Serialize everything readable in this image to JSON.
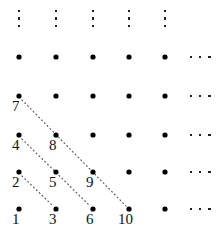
{
  "figure": {
    "width": 222,
    "height": 234,
    "background_color": "#ffffff",
    "dot_color": "#000000",
    "line_color": "#555555",
    "label_color": "#111111"
  },
  "grid": {
    "columns": 5,
    "rows": 5,
    "column_x": [
      19,
      56,
      93,
      129,
      165
    ],
    "row_y": [
      209,
      172,
      135,
      96,
      57
    ],
    "dot_radius": 2.6
  },
  "lattice_points": [
    {
      "id": "dot-c1-r1",
      "col": 1,
      "row": 1,
      "x": 19,
      "y": 209,
      "label": "1"
    },
    {
      "id": "dot-c2-r1",
      "col": 2,
      "row": 1,
      "x": 56,
      "y": 209,
      "label": "3"
    },
    {
      "id": "dot-c3-r1",
      "col": 3,
      "row": 1,
      "x": 93,
      "y": 209,
      "label": "6"
    },
    {
      "id": "dot-c4-r1",
      "col": 4,
      "row": 1,
      "x": 129,
      "y": 209,
      "label": "10"
    },
    {
      "id": "dot-c5-r1",
      "col": 5,
      "row": 1,
      "x": 165,
      "y": 209,
      "label": ""
    },
    {
      "id": "dot-c1-r2",
      "col": 1,
      "row": 2,
      "x": 19,
      "y": 172,
      "label": "2"
    },
    {
      "id": "dot-c2-r2",
      "col": 2,
      "row": 2,
      "x": 56,
      "y": 172,
      "label": "5"
    },
    {
      "id": "dot-c3-r2",
      "col": 3,
      "row": 2,
      "x": 93,
      "y": 172,
      "label": "9"
    },
    {
      "id": "dot-c4-r2",
      "col": 4,
      "row": 2,
      "x": 129,
      "y": 172,
      "label": ""
    },
    {
      "id": "dot-c5-r2",
      "col": 5,
      "row": 2,
      "x": 165,
      "y": 172,
      "label": ""
    },
    {
      "id": "dot-c1-r3",
      "col": 1,
      "row": 3,
      "x": 19,
      "y": 135,
      "label": "4"
    },
    {
      "id": "dot-c2-r3",
      "col": 2,
      "row": 3,
      "x": 56,
      "y": 135,
      "label": "8"
    },
    {
      "id": "dot-c3-r3",
      "col": 3,
      "row": 3,
      "x": 93,
      "y": 135,
      "label": ""
    },
    {
      "id": "dot-c4-r3",
      "col": 4,
      "row": 3,
      "x": 129,
      "y": 135,
      "label": ""
    },
    {
      "id": "dot-c5-r3",
      "col": 5,
      "row": 3,
      "x": 165,
      "y": 135,
      "label": ""
    },
    {
      "id": "dot-c1-r4",
      "col": 1,
      "row": 4,
      "x": 19,
      "y": 96,
      "label": "7"
    },
    {
      "id": "dot-c2-r4",
      "col": 2,
      "row": 4,
      "x": 56,
      "y": 96,
      "label": ""
    },
    {
      "id": "dot-c3-r4",
      "col": 3,
      "row": 4,
      "x": 93,
      "y": 96,
      "label": ""
    },
    {
      "id": "dot-c4-r4",
      "col": 4,
      "row": 4,
      "x": 129,
      "y": 96,
      "label": ""
    },
    {
      "id": "dot-c5-r4",
      "col": 5,
      "row": 4,
      "x": 165,
      "y": 96,
      "label": ""
    },
    {
      "id": "dot-c1-r5",
      "col": 1,
      "row": 5,
      "x": 19,
      "y": 57,
      "label": ""
    },
    {
      "id": "dot-c2-r5",
      "col": 2,
      "row": 5,
      "x": 56,
      "y": 57,
      "label": ""
    },
    {
      "id": "dot-c3-r5",
      "col": 3,
      "row": 5,
      "x": 93,
      "y": 57,
      "label": ""
    },
    {
      "id": "dot-c4-r5",
      "col": 4,
      "row": 5,
      "x": 129,
      "y": 57,
      "label": ""
    },
    {
      "id": "dot-c5-r5",
      "col": 5,
      "row": 5,
      "x": 165,
      "y": 57,
      "label": ""
    }
  ],
  "labels": [
    {
      "id": "label-1",
      "text": "1",
      "x": 12,
      "y": 212
    },
    {
      "id": "label-2",
      "text": "2",
      "x": 12,
      "y": 175
    },
    {
      "id": "label-3",
      "text": "3",
      "x": 49,
      "y": 212
    },
    {
      "id": "label-4",
      "text": "4",
      "x": 12,
      "y": 138
    },
    {
      "id": "label-5",
      "text": "5",
      "x": 49,
      "y": 175
    },
    {
      "id": "label-6",
      "text": "6",
      "x": 86,
      "y": 212
    },
    {
      "id": "label-7",
      "text": "7",
      "x": 12,
      "y": 99
    },
    {
      "id": "label-8",
      "text": "8",
      "x": 49,
      "y": 138
    },
    {
      "id": "label-9",
      "text": "9",
      "x": 86,
      "y": 175
    },
    {
      "id": "label-10",
      "text": "10",
      "x": 118,
      "y": 212
    }
  ],
  "diagonals": [
    {
      "id": "diagonal-2-3",
      "from_label": "2",
      "to_label": "3",
      "x1": 22,
      "y1": 176,
      "x2": 53,
      "y2": 206
    },
    {
      "id": "diagonal-4-6",
      "from_label": "4",
      "to_label": "6",
      "x1": 22,
      "y1": 139,
      "x2": 90,
      "y2": 206
    },
    {
      "id": "diagonal-7-10",
      "from_label": "7",
      "to_label": "10",
      "x1": 22,
      "y1": 100,
      "x2": 126,
      "y2": 206
    }
  ],
  "ellipses_vertical": [
    {
      "id": "vdots-col-1",
      "x": 19,
      "y": 10
    },
    {
      "id": "vdots-col-2",
      "x": 56,
      "y": 10
    },
    {
      "id": "vdots-col-3",
      "x": 93,
      "y": 10
    },
    {
      "id": "vdots-col-4",
      "x": 129,
      "y": 10
    },
    {
      "id": "vdots-col-5",
      "x": 165,
      "y": 10
    }
  ],
  "ellipses_horizontal": [
    {
      "id": "hdots-row-5",
      "x": 200,
      "y": 57
    },
    {
      "id": "hdots-row-4",
      "x": 200,
      "y": 96
    },
    {
      "id": "hdots-row-3",
      "x": 200,
      "y": 135
    },
    {
      "id": "hdots-row-2",
      "x": 200,
      "y": 172
    },
    {
      "id": "hdots-row-1",
      "x": 200,
      "y": 209
    }
  ]
}
